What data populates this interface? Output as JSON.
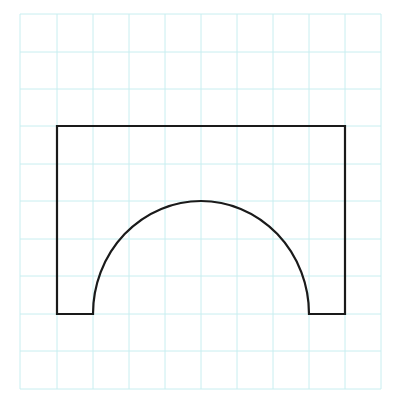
{
  "figure": {
    "width": 401,
    "height": 415,
    "background": "#ffffff"
  },
  "grid": {
    "color": "#c8eef0",
    "stroke_width": 1,
    "x_lines": [
      20,
      57,
      93,
      129,
      165,
      201,
      237,
      273,
      309,
      345,
      381
    ],
    "y_lines": [
      14,
      52,
      89,
      126,
      164,
      201,
      239,
      276,
      314,
      351,
      389
    ],
    "columns": 10,
    "rows": 10
  },
  "shape": {
    "name": "rectangle-with-semicircular-arch-cutout",
    "stroke": "#1a1a1a",
    "stroke_width": 2.2,
    "fill": "none",
    "outer_rect": {
      "left": 57,
      "top": 126,
      "right": 345,
      "bottom": 314
    },
    "arch": {
      "left": 93,
      "right": 309,
      "base_y": 314,
      "peak_y": 201
    },
    "grid_units": {
      "width": 8,
      "height": 5,
      "arch_width": 6,
      "arch_height": 3
    }
  }
}
